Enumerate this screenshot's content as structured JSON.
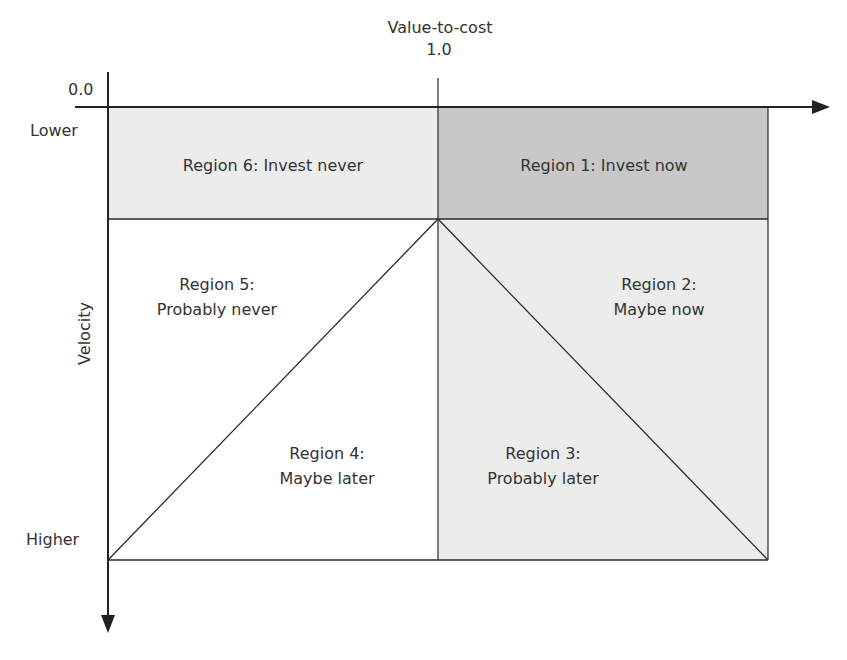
{
  "axes": {
    "x_title": "Value-to-cost",
    "x_tick": "1.0",
    "origin_label": "0.0",
    "y_title": "Velocity",
    "y_top_label": "Lower",
    "y_bottom_label": "Higher"
  },
  "regions": [
    {
      "id": 1,
      "line1": "Region 1: Invest now",
      "line2": "",
      "fill": "#c8c8c8"
    },
    {
      "id": 2,
      "line1": "Region 2:",
      "line2": "Maybe now",
      "fill": "#ececec"
    },
    {
      "id": 3,
      "line1": "Region 3:",
      "line2": "Probably later",
      "fill": "#ececec"
    },
    {
      "id": 4,
      "line1": "Region 4:",
      "line2": "Maybe later",
      "fill": "#ffffff"
    },
    {
      "id": 5,
      "line1": "Region 5:",
      "line2": "Probably never",
      "fill": "#ffffff"
    },
    {
      "id": 6,
      "line1": "Region 6: Invest never",
      "line2": "",
      "fill": "#ececec"
    }
  ],
  "colors": {
    "line": "#2a2a2a",
    "dark_fill": "#c8c8c8",
    "light_fill": "#ececec"
  }
}
